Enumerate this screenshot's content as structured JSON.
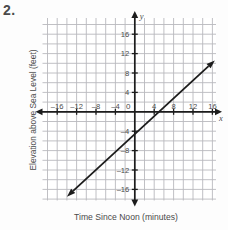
{
  "problem": {
    "number": "2."
  },
  "chart_data": {
    "type": "line",
    "title": "",
    "xlabel": "Time Since Noon (minutes)",
    "ylabel": "Elevation above Sea Level (feet)",
    "axis_name_x": "x",
    "axis_name_y": "y",
    "xlim": [
      -20,
      20
    ],
    "ylim": [
      -20,
      20
    ],
    "grid": true,
    "grid_step": 2,
    "tick_step": 4,
    "xticks": [
      -16,
      -12,
      -8,
      -4,
      0,
      4,
      8,
      12,
      16
    ],
    "yticks": [
      16,
      12,
      8,
      4,
      -4,
      -8,
      -12,
      -16
    ],
    "origin_label": "0",
    "xtick_labels": [
      "-16",
      "-12",
      "-8",
      "-4",
      "4",
      "8",
      "12",
      "16"
    ],
    "ytick_labels": [
      "16",
      "12",
      "8",
      "4",
      "-4",
      "-8",
      "-12",
      "-16"
    ],
    "series": [
      {
        "name": "elevation-line",
        "slope": 1.25,
        "y_intercept": -10,
        "x_intercept": 8,
        "arrow_start": {
          "x": -14,
          "y": -17.5
        },
        "arrow_end": {
          "x": 16.5,
          "y": 10.6
        },
        "points": [
          {
            "x": -14,
            "y": -17.5
          },
          {
            "x": 0,
            "y": -10
          },
          {
            "x": 8,
            "y": 0
          },
          {
            "x": 16.5,
            "y": 10.6
          }
        ]
      }
    ],
    "colors": {
      "grid": "#b9b9bd",
      "axis": "#1c1c1c",
      "line": "#1c1c1c",
      "text": "#4a4a4a",
      "background": "#fdfdfd"
    }
  }
}
